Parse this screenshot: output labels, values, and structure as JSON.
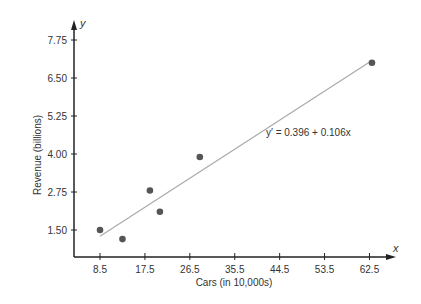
{
  "chart_data": {
    "type": "scatter",
    "title": "",
    "xlabel": "Cars (in 10,000s)",
    "ylabel": "Revenue (billions)",
    "x_axis_var": "x",
    "y_axis_var": "y",
    "x_ticks": [
      "8.5",
      "17.5",
      "26.5",
      "35.5",
      "44.5",
      "53.5",
      "62.5"
    ],
    "y_ticks": [
      "1.50",
      "2.75",
      "4.00",
      "5.25",
      "6.50",
      "7.75"
    ],
    "xlim": [
      0,
      70
    ],
    "ylim": [
      0,
      9
    ],
    "grid": false,
    "points": [
      {
        "x": 8.5,
        "y": 1.5
      },
      {
        "x": 13.0,
        "y": 1.2
      },
      {
        "x": 18.5,
        "y": 2.8
      },
      {
        "x": 20.5,
        "y": 2.1
      },
      {
        "x": 28.5,
        "y": 3.9
      },
      {
        "x": 63.0,
        "y": 7.0
      }
    ],
    "regression": {
      "equation": "y′ = 0.396 + 0.106x",
      "intercept": 0.396,
      "slope": 0.106,
      "x_start": 8.5,
      "x_end": 63.0
    },
    "colors": {
      "points": "#555555",
      "line": "#aaaaaa",
      "axis": "#222222"
    }
  }
}
